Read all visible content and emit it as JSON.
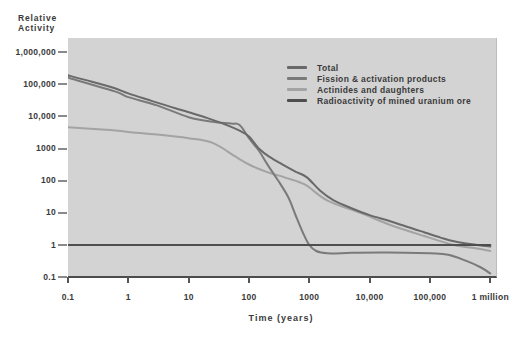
{
  "figure": {
    "y_axis_title_line1": "Relative",
    "y_axis_title_line2": "Activity",
    "x_axis_title": "Time (years)"
  },
  "legend": {
    "items": [
      {
        "label": "Total",
        "color": "#696969"
      },
      {
        "label": "Fission & activation products",
        "color": "#7a7a7a"
      },
      {
        "label": "Actinides and daughters",
        "color": "#a3a3a3"
      },
      {
        "label": "Radioactivity of mined uranium ore",
        "color": "#4e4e4e"
      }
    ]
  },
  "colors": {
    "plot_background": "#d3d3d3",
    "axis_line": "#4c4c4c",
    "text": "#3a3a3a"
  },
  "chart_data": {
    "type": "line",
    "title": "",
    "xlabel": "Time (years)",
    "ylabel": "Relative Activity",
    "x_scale": "log",
    "y_scale": "log",
    "xlim": [
      0.1,
      1000000
    ],
    "ylim": [
      0.1,
      1000000
    ],
    "grid": false,
    "legend_position": "inside-top-right",
    "x_ticks": [
      {
        "label": "0.1",
        "value": 0.1
      },
      {
        "label": "1",
        "value": 1
      },
      {
        "label": "10",
        "value": 10
      },
      {
        "label": "100",
        "value": 100
      },
      {
        "label": "1000",
        "value": 1000
      },
      {
        "label": "10,000",
        "value": 10000
      },
      {
        "label": "100,000",
        "value": 100000
      },
      {
        "label": "1 million",
        "value": 1000000
      }
    ],
    "y_ticks": [
      {
        "label": "1,000,000",
        "value": 1000000
      },
      {
        "label": "100,000",
        "value": 100000
      },
      {
        "label": "10,000",
        "value": 10000
      },
      {
        "label": "1000",
        "value": 1000
      },
      {
        "label": "100",
        "value": 100
      },
      {
        "label": "10",
        "value": 10
      },
      {
        "label": "1",
        "value": 1
      },
      {
        "label": "0.1",
        "value": 0.1
      }
    ],
    "series": [
      {
        "name": "Actinides and daughters",
        "color": "#a3a3a3",
        "width": 2,
        "points": [
          [
            0.1,
            4600
          ],
          [
            0.5,
            3800
          ],
          [
            1,
            3300
          ],
          [
            3,
            2750
          ],
          [
            10,
            2100
          ],
          [
            25,
            1500
          ],
          [
            60,
            560
          ],
          [
            100,
            320
          ],
          [
            200,
            185
          ],
          [
            400,
            125
          ],
          [
            850,
            75
          ],
          [
            2000,
            24
          ],
          [
            7000,
            10
          ],
          [
            22000,
            4.2
          ],
          [
            80000,
            1.9
          ],
          [
            250000,
            1.0
          ],
          [
            600000,
            0.78
          ],
          [
            1000000,
            0.65
          ]
        ]
      },
      {
        "name": "Fission & activation products",
        "color": "#7a7a7a",
        "width": 2,
        "points": [
          [
            0.1,
            160000
          ],
          [
            0.6,
            60000
          ],
          [
            1,
            40000
          ],
          [
            3,
            22000
          ],
          [
            10,
            9500
          ],
          [
            25,
            6800
          ],
          [
            50,
            6000
          ],
          [
            70,
            5400
          ],
          [
            100,
            2100
          ],
          [
            150,
            800
          ],
          [
            200,
            330
          ],
          [
            300,
            105
          ],
          [
            450,
            30
          ],
          [
            600,
            8
          ],
          [
            800,
            2.2
          ],
          [
            1000,
            1.0
          ],
          [
            1300,
            0.65
          ],
          [
            2000,
            0.55
          ],
          [
            5000,
            0.57
          ],
          [
            20000,
            0.58
          ],
          [
            100000,
            0.55
          ],
          [
            200000,
            0.5
          ],
          [
            400000,
            0.32
          ],
          [
            700000,
            0.2
          ],
          [
            1000000,
            0.13
          ]
        ]
      },
      {
        "name": "Total",
        "color": "#696969",
        "width": 2,
        "points": [
          [
            0.1,
            190000
          ],
          [
            0.25,
            120000
          ],
          [
            0.6,
            75000
          ],
          [
            1,
            52000
          ],
          [
            2.5,
            30000
          ],
          [
            6,
            18000
          ],
          [
            10,
            13500
          ],
          [
            20,
            9000
          ],
          [
            45,
            5200
          ],
          [
            70,
            3600
          ],
          [
            100,
            2400
          ],
          [
            150,
            950
          ],
          [
            220,
            550
          ],
          [
            350,
            330
          ],
          [
            600,
            190
          ],
          [
            900,
            130
          ],
          [
            1500,
            50
          ],
          [
            2500,
            25
          ],
          [
            5000,
            14
          ],
          [
            10000,
            8.5
          ],
          [
            22000,
            5.5
          ],
          [
            50000,
            3.3
          ],
          [
            80000,
            2.5
          ],
          [
            150000,
            1.7
          ],
          [
            250000,
            1.3
          ],
          [
            500000,
            1.05
          ],
          [
            1000000,
            0.9
          ]
        ]
      },
      {
        "name": "Radioactivity of mined uranium ore",
        "color": "#4e4e4e",
        "width": 2.2,
        "points": [
          [
            0.1,
            1
          ],
          [
            1000000,
            1
          ]
        ]
      }
    ]
  }
}
